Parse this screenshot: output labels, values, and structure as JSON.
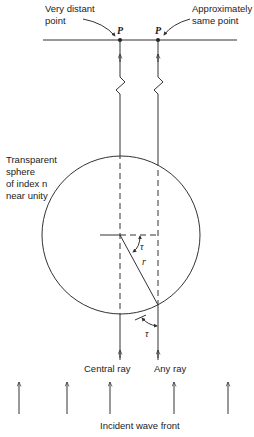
{
  "diagram": {
    "title": "",
    "labels": {
      "distant_point_line1": "Very distant",
      "distant_point_line2": "point",
      "same_point_line1": "Approximately",
      "same_point_line2": "same point",
      "point_p_left": "P",
      "point_p_right": "P",
      "sphere_line1": "Transparent",
      "sphere_line2": "sphere",
      "sphere_line3": "of index n",
      "sphere_line4": "near unity",
      "angle_tau_upper": "τ",
      "radius_r": "r",
      "angle_tau_lower": "τ",
      "central_ray": "Central ray",
      "any_ray": "Any ray",
      "incident_wave_front": "Incident wave front"
    },
    "colors": {
      "line": "#333333",
      "text": "#222222",
      "background": "#ffffff"
    }
  }
}
